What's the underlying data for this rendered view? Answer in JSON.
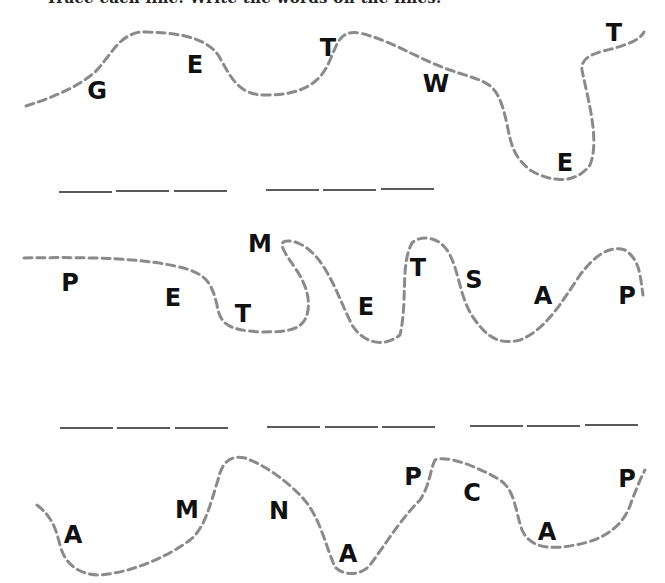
{
  "heading": "Trace each line. Write the words on the lines.",
  "rows": [
    {
      "letters": [
        {
          "char": "G",
          "x": 97,
          "y": 91
        },
        {
          "char": "E",
          "x": 195,
          "y": 65
        },
        {
          "char": "T",
          "x": 328,
          "y": 48
        },
        {
          "char": "W",
          "x": 436,
          "y": 84
        },
        {
          "char": "E",
          "x": 565,
          "y": 163
        },
        {
          "char": "T",
          "x": 614,
          "y": 33
        }
      ],
      "blank_groups": [
        3,
        3
      ]
    },
    {
      "letters": [
        {
          "char": "P",
          "x": 70,
          "y": 283
        },
        {
          "char": "E",
          "x": 173,
          "y": 298
        },
        {
          "char": "T",
          "x": 243,
          "y": 314
        },
        {
          "char": "M",
          "x": 260,
          "y": 244
        },
        {
          "char": "E",
          "x": 366,
          "y": 307
        },
        {
          "char": "T",
          "x": 418,
          "y": 268
        },
        {
          "char": "S",
          "x": 474,
          "y": 280
        },
        {
          "char": "A",
          "x": 543,
          "y": 296
        },
        {
          "char": "P",
          "x": 627,
          "y": 296
        }
      ],
      "blank_groups": [
        3,
        3,
        3
      ]
    },
    {
      "letters": [
        {
          "char": "A",
          "x": 73,
          "y": 535
        },
        {
          "char": "M",
          "x": 187,
          "y": 510
        },
        {
          "char": "N",
          "x": 279,
          "y": 511
        },
        {
          "char": "A",
          "x": 348,
          "y": 554
        },
        {
          "char": "P",
          "x": 413,
          "y": 477
        },
        {
          "char": "C",
          "x": 472,
          "y": 493
        },
        {
          "char": "A",
          "x": 547,
          "y": 532
        },
        {
          "char": "P",
          "x": 627,
          "y": 479
        }
      ],
      "blank_groups": []
    }
  ],
  "colors": {
    "trace_line": "#8a8a8a",
    "blank_line": "#5a5a5a",
    "letter": "#111111"
  }
}
